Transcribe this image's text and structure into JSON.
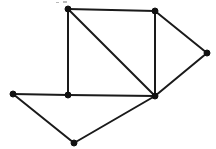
{
  "figure": {
    "background_color": "#ffffff",
    "line_color": "#1a1a1a",
    "vertex_color": "#111111",
    "line_width": 2,
    "vertex_radius": 3,
    "width": 216,
    "height": 149
  },
  "graph": {
    "vertex_count": 7,
    "edge_count": 10,
    "vertices": [
      {
        "id": "v1",
        "label": "top-left",
        "x": 68,
        "y": 9
      },
      {
        "id": "v2",
        "label": "top-right",
        "x": 155,
        "y": 11
      },
      {
        "id": "v3",
        "label": "right",
        "x": 207,
        "y": 53
      },
      {
        "id": "v4",
        "label": "hub",
        "x": 155,
        "y": 96
      },
      {
        "id": "v5",
        "label": "mid-left",
        "x": 68,
        "y": 95
      },
      {
        "id": "v6",
        "label": "far-left",
        "x": 13,
        "y": 94
      },
      {
        "id": "v7",
        "label": "bottom",
        "x": 74,
        "y": 143
      }
    ],
    "edges": [
      {
        "id": "e1",
        "from": "v1",
        "to": "v2"
      },
      {
        "id": "e2",
        "from": "v1",
        "to": "v5"
      },
      {
        "id": "e3",
        "from": "v1",
        "to": "v4"
      },
      {
        "id": "e4",
        "from": "v2",
        "to": "v3"
      },
      {
        "id": "e5",
        "from": "v2",
        "to": "v4"
      },
      {
        "id": "e6",
        "from": "v3",
        "to": "v4"
      },
      {
        "id": "e7",
        "from": "v4",
        "to": "v5"
      },
      {
        "id": "e8",
        "from": "v4",
        "to": "v7"
      },
      {
        "id": "e9",
        "from": "v5",
        "to": "v6"
      },
      {
        "id": "e10",
        "from": "v6",
        "to": "v7"
      }
    ],
    "artifacts": [
      {
        "id": "a1",
        "x": 63,
        "y": 1,
        "width": 4,
        "height": 2,
        "color": "#b9b9b9"
      },
      {
        "id": "a2",
        "x": 56,
        "y": 2,
        "width": 3,
        "height": 1,
        "color": "#cccccc"
      }
    ]
  }
}
